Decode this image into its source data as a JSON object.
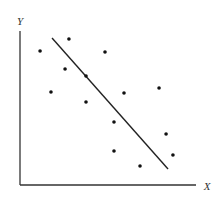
{
  "chart_data": {
    "type": "scatter",
    "title": "",
    "xlabel": "X",
    "ylabel": "Y",
    "xlim": [
      0,
      100
    ],
    "ylim": [
      0,
      100
    ],
    "grid": false,
    "legend": null,
    "ticks": {
      "x": [],
      "y": []
    },
    "series": [
      {
        "name": "observations",
        "marker": "dot",
        "color": "#111111",
        "points": [
          {
            "x": 11.4,
            "y": 87.0
          },
          {
            "x": 27.8,
            "y": 94.8
          },
          {
            "x": 17.6,
            "y": 60.4
          },
          {
            "x": 25.6,
            "y": 75.3
          },
          {
            "x": 37.5,
            "y": 70.8
          },
          {
            "x": 37.5,
            "y": 53.9
          },
          {
            "x": 48.3,
            "y": 86.4
          },
          {
            "x": 59.1,
            "y": 59.7
          },
          {
            "x": 79.0,
            "y": 63.0
          },
          {
            "x": 53.4,
            "y": 40.9
          },
          {
            "x": 53.4,
            "y": 22.1
          },
          {
            "x": 83.0,
            "y": 33.1
          },
          {
            "x": 86.9,
            "y": 19.5
          },
          {
            "x": 68.2,
            "y": 12.3
          }
        ]
      }
    ],
    "annotations": [
      {
        "type": "line",
        "name": "fitted-regression-line",
        "color": "#222222",
        "from": {
          "x": 18.2,
          "y": 95.5
        },
        "to": {
          "x": 84.1,
          "y": 10.4
        }
      }
    ]
  },
  "layout": {
    "plot": {
      "left": 20,
      "right": 196,
      "top": 31,
      "bottom": 185
    },
    "xlabel_pos": {
      "x": 207,
      "y": 190
    },
    "ylabel_pos": {
      "x": 20,
      "y": 25
    },
    "dot_radius": 1.8
  }
}
